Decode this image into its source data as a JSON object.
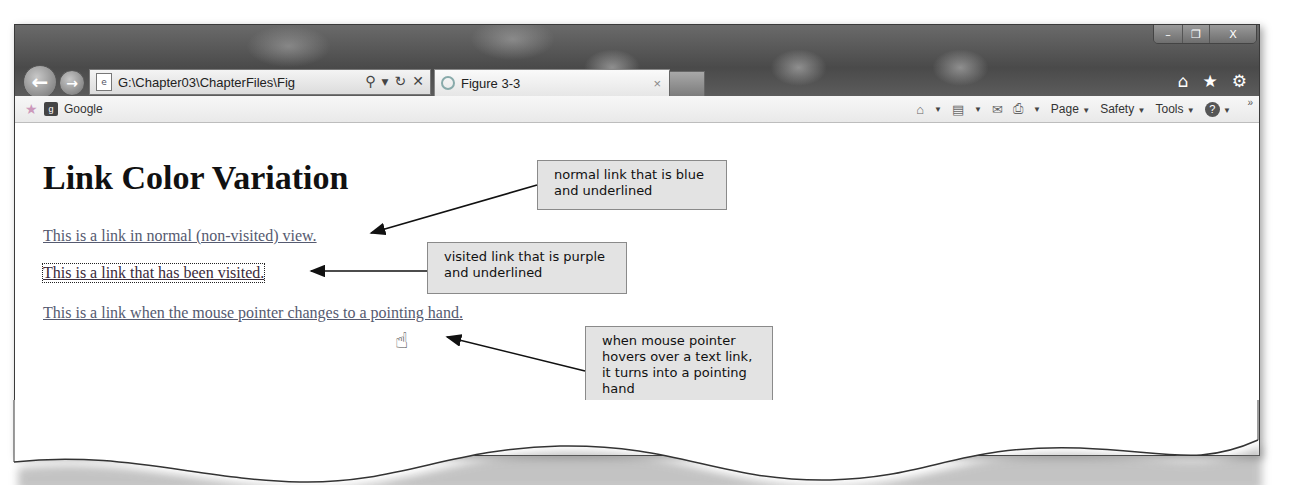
{
  "browser": {
    "address_bar": {
      "url": "G:\\Chapter03\\ChapterFiles\\Fig",
      "search_icon": "search-icon",
      "dropdown_icon": "chevron-down-icon",
      "refresh_icon": "refresh-icon",
      "stop_icon": "close-icon"
    },
    "tab": {
      "title": "Figure 3-3",
      "close_label": "×"
    },
    "window_controls": {
      "minimize": "–",
      "maximize": "❐",
      "close": "X"
    },
    "right_icons": [
      "home-icon",
      "favorites-star-icon",
      "settings-gear-icon"
    ],
    "favorites_bar": {
      "item": "Google"
    },
    "command_bar": {
      "items": [
        {
          "icon": "home-icon",
          "label": ""
        },
        {
          "icon": "rss-feed-icon",
          "label": ""
        },
        {
          "icon": "mail-icon",
          "label": ""
        },
        {
          "icon": "print-icon",
          "label": ""
        },
        {
          "label": "Page"
        },
        {
          "label": "Safety"
        },
        {
          "label": "Tools"
        },
        {
          "icon": "help-icon",
          "label": ""
        }
      ],
      "overflow": "»"
    }
  },
  "page": {
    "heading": "Link Color Variation",
    "links": {
      "normal": "This is a link in normal (non-visited) view.",
      "visited": "This is a link that has been visited.",
      "hover": "This is a link when the mouse pointer changes to a pointing hand."
    }
  },
  "callouts": {
    "normal": "normal link that is blue and underlined",
    "visited": "visited link that is purple and underlined",
    "hover": "when mouse pointer hovers over a text link, it turns into a pointing hand"
  },
  "colors": {
    "callout_bg": "#e3e3e3",
    "link_normal": "#555a70",
    "link_visited": "#3a2a3a"
  }
}
